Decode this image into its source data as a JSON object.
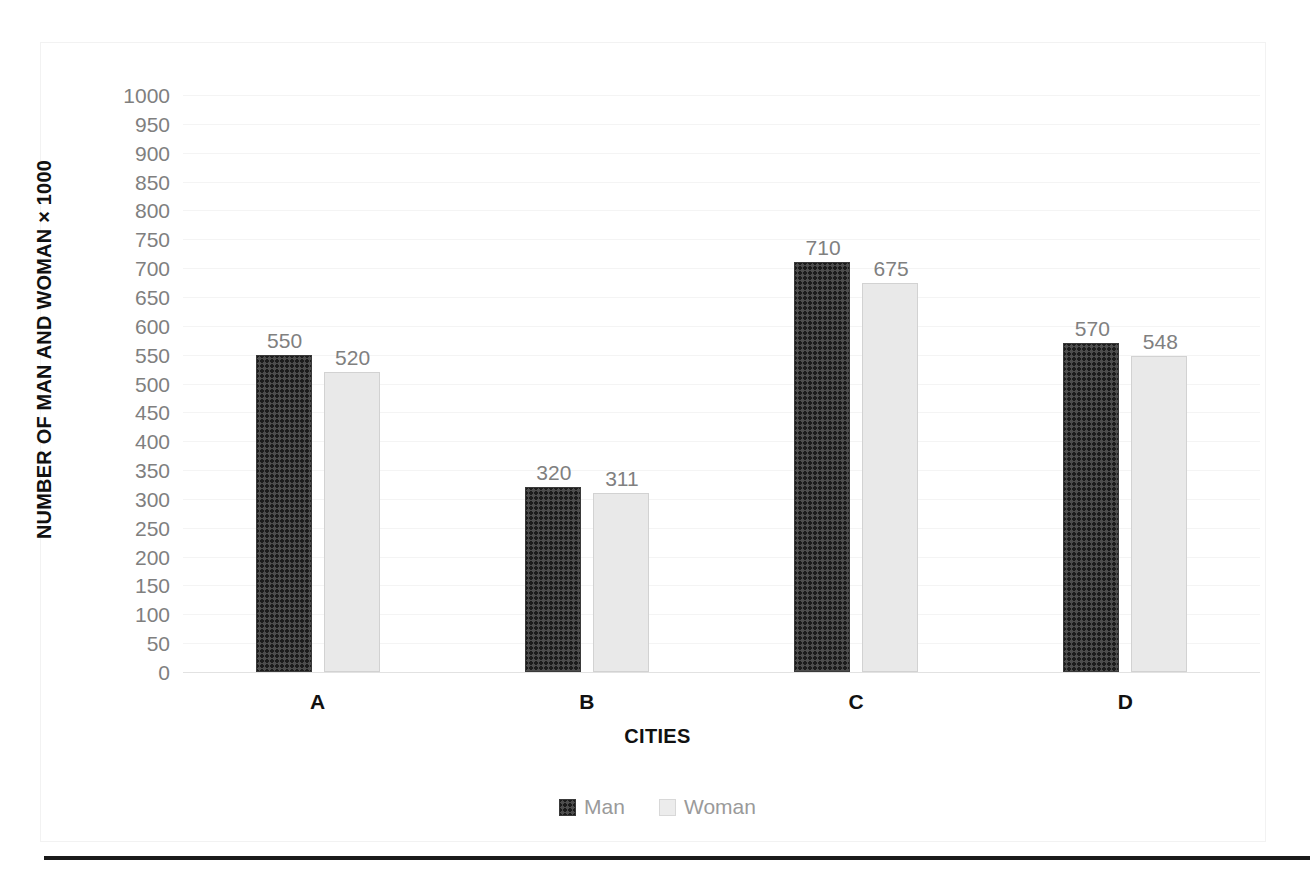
{
  "chart_data": {
    "type": "bar",
    "title": "",
    "subtitle": "",
    "xlabel": "CITIES",
    "ylabel": "NUMBER OF MAN AND WOMAN × 1000",
    "categories": [
      "A",
      "B",
      "C",
      "D"
    ],
    "series": [
      {
        "name": "Man",
        "values": [
          550,
          320,
          710,
          570
        ],
        "color": "#3a3a3a",
        "fill": "crosshatch-dark"
      },
      {
        "name": "Woman",
        "values": [
          520,
          311,
          675,
          548
        ],
        "color": "#e9e9e9",
        "fill": "solid-light-gray"
      }
    ],
    "ylim": [
      0,
      1000
    ],
    "ytick_step": 50,
    "yticks": [
      1000,
      950,
      900,
      850,
      800,
      750,
      700,
      650,
      600,
      550,
      500,
      450,
      400,
      350,
      300,
      250,
      200,
      150,
      100,
      50,
      0
    ],
    "grid": true,
    "grid_axis": "y",
    "legend": true,
    "legend_position": "bottom",
    "data_labels": true,
    "data_label_color": "#808080",
    "background": "#ffffff",
    "bar_labels": {
      "A": {
        "Man": "550",
        "Woman": "520"
      },
      "B": {
        "Man": "320",
        "Woman": "311"
      },
      "C": {
        "Man": "710",
        "Woman": "675"
      },
      "D": {
        "Man": "570",
        "Woman": "548"
      }
    }
  },
  "axes": {
    "y_title": "NUMBER OF MAN AND WOMAN × 1000",
    "x_title": "CITIES",
    "y_tick_labels": [
      "1000",
      "950",
      "900",
      "850",
      "800",
      "750",
      "700",
      "650",
      "600",
      "550",
      "500",
      "450",
      "400",
      "350",
      "300",
      "250",
      "200",
      "150",
      "100",
      "50",
      "0"
    ],
    "x_tick_labels": [
      "A",
      "B",
      "C",
      "D"
    ]
  },
  "legend": {
    "items": [
      {
        "label": "Man",
        "swatch": "crosshatch-dark-swatch"
      },
      {
        "label": "Woman",
        "swatch": "light-gray-swatch"
      }
    ]
  },
  "labels": {
    "a_man": "550",
    "a_woman": "520",
    "b_man": "320",
    "b_woman": "311",
    "c_man": "710",
    "c_woman": "675",
    "d_man": "570",
    "d_woman": "548"
  }
}
